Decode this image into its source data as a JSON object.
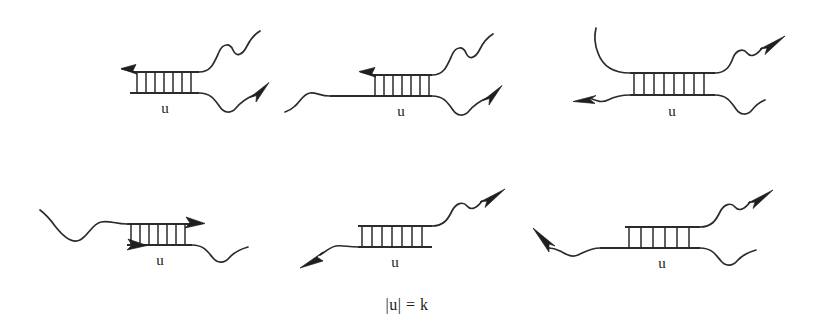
{
  "figure": {
    "type": "diagram",
    "caption": "|u| = k",
    "duplex_label": "u",
    "ink_color": "#2b2b2b",
    "background_color": "#ffffff",
    "grid": {
      "columns": 3,
      "rows": 2,
      "panel_count": 6
    },
    "panels": [
      {
        "id": "panel-1",
        "row": 1,
        "column": 1,
        "duplex_label": "u",
        "rung_count": 7,
        "arms": [
          {
            "name": "top-left",
            "direction": "left",
            "arrowhead": true,
            "shape": "straight"
          },
          {
            "name": "top-right",
            "direction": "up-right",
            "arrowhead": false,
            "shape": "wavy"
          },
          {
            "name": "bottom-right",
            "direction": "up-right",
            "arrowhead": true,
            "shape": "wavy"
          }
        ]
      },
      {
        "id": "panel-2",
        "row": 1,
        "column": 2,
        "duplex_label": "u",
        "rung_count": 7,
        "arms": [
          {
            "name": "top-left",
            "direction": "left",
            "arrowhead": true,
            "shape": "straight"
          },
          {
            "name": "top-right",
            "direction": "up-right",
            "arrowhead": false,
            "shape": "wavy"
          },
          {
            "name": "bottom-left",
            "direction": "left",
            "arrowhead": false,
            "shape": "wavy"
          },
          {
            "name": "bottom-right",
            "direction": "up-right",
            "arrowhead": true,
            "shape": "wavy"
          }
        ]
      },
      {
        "id": "panel-3",
        "row": 1,
        "column": 3,
        "duplex_label": "u",
        "rung_count": 8,
        "arms": [
          {
            "name": "top-left",
            "direction": "up",
            "arrowhead": false,
            "shape": "curved"
          },
          {
            "name": "top-right",
            "direction": "up-right",
            "arrowhead": true,
            "shape": "wavy"
          },
          {
            "name": "bottom-left",
            "direction": "left",
            "arrowhead": true,
            "shape": "wavy"
          },
          {
            "name": "bottom-right",
            "direction": "down-right",
            "arrowhead": false,
            "shape": "wavy"
          }
        ]
      },
      {
        "id": "panel-4",
        "row": 2,
        "column": 1,
        "duplex_label": "u",
        "rung_count": 7,
        "arms": [
          {
            "name": "top-left",
            "direction": "up-left",
            "arrowhead": false,
            "shape": "wavy"
          },
          {
            "name": "top-right",
            "direction": "right",
            "arrowhead": true,
            "shape": "straight"
          },
          {
            "name": "bottom-left",
            "direction": "right",
            "arrowhead": true,
            "shape": "straight"
          },
          {
            "name": "bottom-right",
            "direction": "right",
            "arrowhead": false,
            "shape": "wavy"
          }
        ]
      },
      {
        "id": "panel-5",
        "row": 2,
        "column": 2,
        "duplex_label": "u",
        "rung_count": 7,
        "arms": [
          {
            "name": "top-right",
            "direction": "up-right",
            "arrowhead": true,
            "shape": "wavy"
          },
          {
            "name": "bottom-left",
            "direction": "down-left",
            "arrowhead": true,
            "shape": "wavy"
          }
        ]
      },
      {
        "id": "panel-6",
        "row": 2,
        "column": 3,
        "duplex_label": "u",
        "rung_count": 6,
        "arms": [
          {
            "name": "top-right",
            "direction": "up-right",
            "arrowhead": true,
            "shape": "wavy"
          },
          {
            "name": "bottom-left",
            "direction": "up-left",
            "arrowhead": true,
            "shape": "wavy"
          },
          {
            "name": "bottom-right",
            "direction": "right",
            "arrowhead": false,
            "shape": "wavy"
          }
        ]
      }
    ]
  }
}
